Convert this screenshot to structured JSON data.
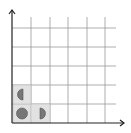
{
  "diagram": {
    "type": "grid-with-axes",
    "columns": 6,
    "rows": 6,
    "colors": {
      "background": "#ffffff",
      "grid_line": "#999999",
      "axis": "#222222",
      "cell_fill": "#e2e2e2",
      "cell_border": "#bbbbbb",
      "shape_fill": "#777777",
      "shape_stroke": "#555555"
    },
    "shaded_cells": [
      {
        "col": 0,
        "row": 0,
        "shape": "full-circle"
      },
      {
        "col": 1,
        "row": 0,
        "shape": "right-half-circle"
      },
      {
        "col": 0,
        "row": 1,
        "shape": "left-half-circle"
      }
    ]
  }
}
